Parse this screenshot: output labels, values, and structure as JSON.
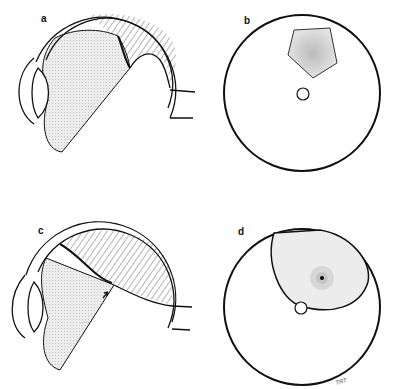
{
  "figure": {
    "panels": [
      {
        "id": "a",
        "label": "a",
        "view": "cross-section",
        "description": "Eye cross-section with detached vitreous (stippled) and hatched superior region with flap"
      },
      {
        "id": "b",
        "label": "b",
        "view": "fundus",
        "description": "Fundus view with star-shaped lesion superior to optic disc"
      },
      {
        "id": "c",
        "label": "c",
        "view": "cross-section",
        "description": "Eye cross-section with large hatched superior region; arrow marks break point"
      },
      {
        "id": "d",
        "label": "d",
        "view": "fundus",
        "description": "Fundus view with large elliptical superior detachment and radiating stipple, disc at margin"
      }
    ],
    "signature": "TRT",
    "colors": {
      "line": "#111111",
      "stipple": "#e6e6e6",
      "background": "#ffffff"
    }
  }
}
